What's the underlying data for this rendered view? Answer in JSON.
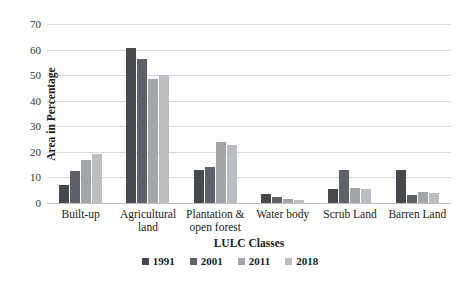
{
  "chart_data": {
    "type": "bar",
    "title": "",
    "xlabel": "LULC Classes",
    "ylabel": "Area in Percentage",
    "ylim": [
      0,
      70
    ],
    "yticks": [
      0,
      10,
      20,
      30,
      40,
      50,
      60,
      70
    ],
    "grid": true,
    "legend_position": "bottom",
    "categories": [
      "Built-up",
      "Agricultural land",
      "Plantation & open forest",
      "Water body",
      "Scrub Land",
      "Barren Land"
    ],
    "series": [
      {
        "name": "1991",
        "color": "#45484d",
        "values": [
          7,
          60.5,
          13,
          3.5,
          5.5,
          13
        ]
      },
      {
        "name": "2001",
        "color": "#5e6268",
        "values": [
          12.5,
          56.5,
          14,
          2.5,
          13,
          3
        ]
      },
      {
        "name": "2011",
        "color": "#a2a6ab",
        "values": [
          17,
          48.5,
          24,
          1.5,
          6,
          4.5
        ]
      },
      {
        "name": "2018",
        "color": "#bbbfc4",
        "values": [
          19,
          50,
          22.5,
          1,
          5.5,
          4
        ]
      }
    ]
  }
}
